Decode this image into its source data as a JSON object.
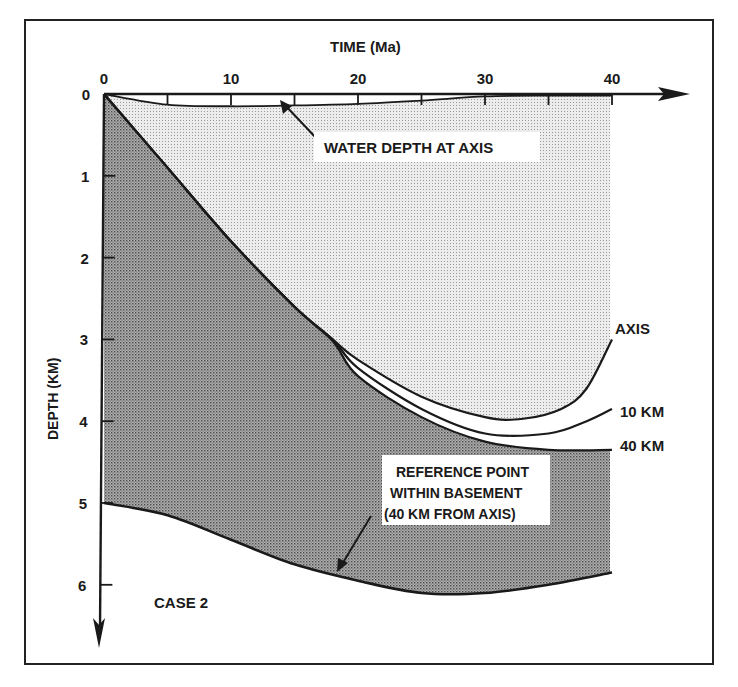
{
  "chart_data": {
    "type": "line",
    "title": "TIME (Ma)",
    "xlabel": "TIME (Ma)",
    "ylabel": "DEPTH (KM)",
    "xlim": [
      0,
      40
    ],
    "ylim": [
      0,
      6
    ],
    "y_inverted": true,
    "x_ticks": [
      0,
      10,
      20,
      30,
      40
    ],
    "x_minor_ticks": [
      5,
      15,
      25,
      35
    ],
    "y_ticks": [
      0,
      1,
      2,
      3,
      4,
      5,
      6
    ],
    "grid": false,
    "series": [
      {
        "name": "WATER DEPTH AT AXIS",
        "x": [
          0,
          5,
          10,
          15,
          20,
          25,
          30,
          35,
          40
        ],
        "y": [
          0,
          0.13,
          0.15,
          0.14,
          0.12,
          0.08,
          0.03,
          0.02,
          0.02
        ]
      },
      {
        "name": "AXIS",
        "x": [
          0,
          5,
          10,
          15,
          18,
          20,
          25,
          30,
          33,
          36,
          38,
          40
        ],
        "y": [
          0,
          0.9,
          1.8,
          2.6,
          3.0,
          3.25,
          3.7,
          3.95,
          3.97,
          3.85,
          3.6,
          3.0
        ]
      },
      {
        "name": "10 KM",
        "x": [
          0,
          5,
          10,
          15,
          18,
          20,
          25,
          30,
          35,
          38,
          40
        ],
        "y": [
          0,
          0.9,
          1.8,
          2.6,
          3.0,
          3.35,
          3.85,
          4.15,
          4.15,
          4.0,
          3.85
        ]
      },
      {
        "name": "40 KM",
        "x": [
          0,
          5,
          10,
          15,
          18,
          20,
          25,
          30,
          35,
          40
        ],
        "y": [
          0,
          0.9,
          1.8,
          2.6,
          3.02,
          3.45,
          3.95,
          4.25,
          4.35,
          4.35
        ]
      },
      {
        "name": "REFERENCE POINT WITHIN BASEMENT (40 KM FROM AXIS)",
        "x": [
          0,
          5,
          10,
          15,
          20,
          25,
          30,
          35,
          40
        ],
        "y": [
          5.0,
          5.15,
          5.45,
          5.75,
          5.95,
          6.1,
          6.1,
          6.0,
          5.85
        ]
      }
    ],
    "annotations": [
      "WATER DEPTH AT AXIS",
      "AXIS",
      "10 KM",
      "40 KM",
      "REFERENCE POINT WITHIN BASEMENT (40 KM FROM AXIS)",
      "CASE 2"
    ]
  },
  "labels": {
    "title": "TIME (Ma)",
    "ylabel": "DEPTH (KM)",
    "water": "WATER DEPTH AT AXIS",
    "axis": "AXIS",
    "km10": "10 KM",
    "km40": "40 KM",
    "ref1": "REFERENCE POINT",
    "ref2": "WITHIN  BASEMENT",
    "ref3": "(40 KM  FROM  AXIS)",
    "case": "CASE  2"
  },
  "colors": {
    "light_fill": "#d8d8d8",
    "dark_fill": "#9a9a9a",
    "ink": "#1a1a1a"
  }
}
